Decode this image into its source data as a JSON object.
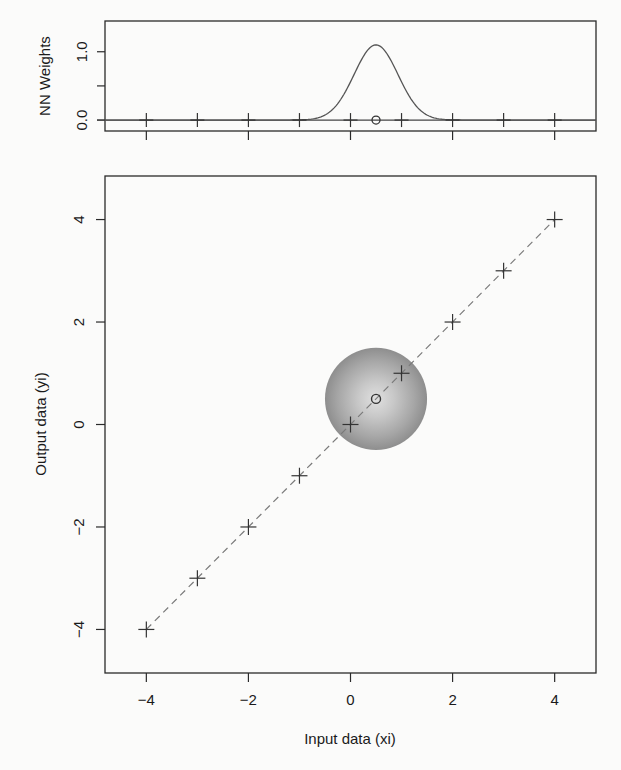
{
  "chart_data": [
    {
      "panel": "top",
      "type": "line",
      "title": "",
      "xlabel": "",
      "ylabel": "NN Weights",
      "xlim": [
        -4.81,
        4.81
      ],
      "ylim": [
        -0.16,
        1.45
      ],
      "yticks": [
        0.0,
        0.5,
        1.0
      ],
      "ytick_labels": [
        "0.0",
        "",
        "1.0"
      ],
      "xticks": [
        -4,
        -2,
        0,
        2,
        4
      ],
      "xtick_labels": [
        "",
        "",
        "",
        "",
        ""
      ],
      "grid": false,
      "series": [
        {
          "name": "kernel weights",
          "style": "solid line",
          "kernel": "gaussian",
          "center": 0.5,
          "sigma": 0.43,
          "peak": 1.1
        },
        {
          "name": "training points",
          "style": "plus markers",
          "x": [
            -4,
            -3,
            -2,
            -1,
            0,
            1,
            2,
            3,
            4
          ],
          "y": [
            0,
            0,
            0,
            0,
            0,
            0,
            0,
            0,
            0
          ]
        },
        {
          "name": "query point",
          "style": "open circle",
          "x": [
            0.5
          ],
          "y": [
            0
          ]
        }
      ],
      "baseline": 0
    },
    {
      "panel": "bottom",
      "type": "scatter",
      "title": "",
      "xlabel": "Input data (xi)",
      "ylabel": "Output data (yi)",
      "xlim": [
        -4.81,
        4.81
      ],
      "ylim": [
        -4.85,
        4.85
      ],
      "xticks": [
        -4,
        -2,
        0,
        2,
        4
      ],
      "xtick_labels": [
        "−4",
        "−2",
        "0",
        "2",
        "4"
      ],
      "yticks": [
        -4,
        -2,
        0,
        2,
        4
      ],
      "ytick_labels": [
        "−4",
        "−2",
        "0",
        "2",
        "4"
      ],
      "grid": false,
      "series": [
        {
          "name": "training data",
          "style": "plus markers",
          "x": [
            -4,
            -3,
            -2,
            -1,
            0,
            1,
            2,
            3,
            4
          ],
          "y": [
            -4,
            -3,
            -2,
            -1,
            0,
            1,
            2,
            3,
            4
          ]
        },
        {
          "name": "identity line",
          "style": "dashed line",
          "x": [
            -4,
            4
          ],
          "y": [
            -4,
            4
          ]
        },
        {
          "name": "query point",
          "style": "open circle",
          "x": [
            0.5
          ],
          "y": [
            0.5
          ]
        }
      ],
      "annotations": [
        {
          "type": "radial gradient disk",
          "center": [
            0.5,
            0.5
          ],
          "radius": 1.0,
          "inner_color": "#dcdcdc",
          "outer_color": "#8e8e8e"
        }
      ]
    }
  ],
  "colors": {
    "axis": "#2a2a2a",
    "line": "#555555",
    "dashed": "#7a7a7a",
    "marker": "#333333",
    "background": "#fbfbfa"
  }
}
